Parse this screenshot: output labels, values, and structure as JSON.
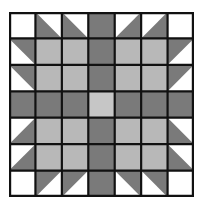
{
  "colors": {
    "white": "#ffffff",
    "dark": "#7a7a7a",
    "light": "#b8b8b8",
    "center": "#c6c6c6",
    "border": "#111111"
  },
  "grid": {
    "rows": 7,
    "cols": 7,
    "legend": "W=white, D=dark gray, L=light gray, C=center light; T-xx = half-square triangle with dark half at corner xx (tl,tr,bl,br)",
    "cells": [
      [
        "W",
        "T-bl",
        "T-bl",
        "D",
        "T-br",
        "T-br",
        "W"
      ],
      [
        "T-tr",
        "L",
        "L",
        "D",
        "L",
        "L",
        "T-tl"
      ],
      [
        "T-tr",
        "L",
        "L",
        "D",
        "L",
        "L",
        "T-tl"
      ],
      [
        "D",
        "D",
        "D",
        "C",
        "D",
        "D",
        "D"
      ],
      [
        "T-br",
        "L",
        "L",
        "D",
        "L",
        "L",
        "T-bl"
      ],
      [
        "T-br",
        "L",
        "L",
        "D",
        "L",
        "L",
        "T-bl"
      ],
      [
        "W",
        "T-tl",
        "T-tl",
        "D",
        "T-tr",
        "T-tr",
        "W"
      ]
    ]
  }
}
